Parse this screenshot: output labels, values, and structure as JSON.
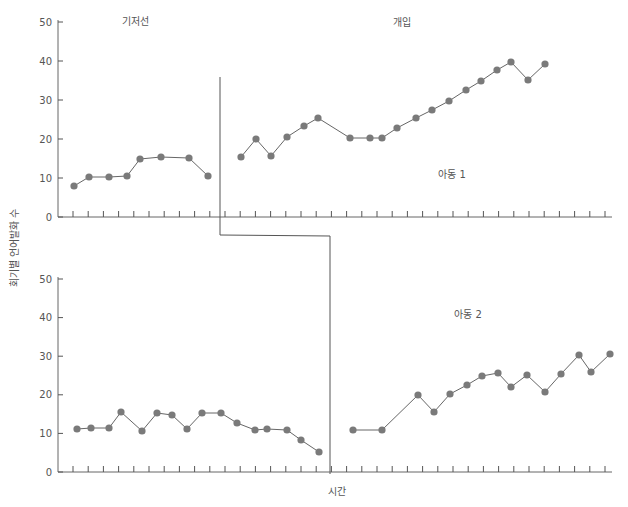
{
  "figure": {
    "y_axis_label": "회기별 언어발화 수",
    "x_axis_label": "시간",
    "phase_labels": {
      "baseline": "기저선",
      "intervention": "개입"
    },
    "colors": {
      "axis": "#555555",
      "line": "#666666",
      "marker": "#7a7a7a",
      "text": "#555555"
    }
  },
  "chart_data": [
    {
      "type": "line",
      "title": "아동 1",
      "xlabel": "",
      "ylabel": "회기별 언어발화 수",
      "ylim": [
        0,
        50
      ],
      "yticks": [
        0,
        10,
        20,
        30,
        40,
        50
      ],
      "grid": false,
      "phase_change_after_session": 10,
      "series": [
        {
          "name": "기저선",
          "x": [
            1,
            2,
            3,
            4,
            5,
            6,
            7,
            8,
            9,
            10
          ],
          "values": [
            8,
            10,
            10,
            10.5,
            14.5,
            15.2,
            null,
            15,
            10.5,
            null
          ]
        },
        {
          "name": "개입",
          "x": [
            12,
            13,
            14,
            15,
            16,
            17,
            18,
            19,
            20,
            21,
            22,
            23,
            24,
            25,
            26,
            27,
            28,
            29,
            30,
            31
          ],
          "values": [
            15,
            20,
            15.5,
            20.2,
            23,
            25,
            20,
            20,
            20,
            22.5,
            25,
            27.3,
            29.5,
            32.3,
            34.5,
            37.5,
            39.7,
            35,
            39.2,
            null
          ]
        }
      ]
    },
    {
      "type": "line",
      "title": "아동 2",
      "xlabel": "시간",
      "ylabel": "회기별 언어발화 수",
      "ylim": [
        0,
        50
      ],
      "yticks": [
        0,
        10,
        20,
        30,
        40,
        50
      ],
      "grid": false,
      "phase_change_after_session": 17,
      "series": [
        {
          "name": "기저선",
          "x": [
            1,
            2,
            3,
            4,
            5,
            6,
            7,
            8,
            9,
            10,
            11,
            12,
            13,
            14,
            15,
            16,
            17
          ],
          "values": [
            11,
            11.2,
            11.2,
            15.5,
            10.5,
            15,
            14.5,
            11,
            15,
            15,
            12.5,
            10.8,
            11.2,
            10.8,
            8,
            5
          ]
        },
        {
          "name": "개입",
          "x": [
            19,
            20,
            21,
            22,
            23,
            24,
            25,
            26,
            27,
            28,
            29,
            30,
            31,
            32,
            33,
            34,
            35
          ],
          "values": [
            10.5,
            10.5,
            19.8,
            15.2,
            20,
            22.3,
            24.5,
            25.5,
            21.6,
            24.8,
            20.4,
            25.2,
            30,
            25.5,
            30.2
          ]
        }
      ]
    }
  ],
  "plot": {
    "top": {
      "label": "아동 1",
      "baseline_points": [
        [
          74,
          186
        ],
        [
          89,
          177
        ],
        [
          109,
          177
        ],
        [
          127,
          176
        ],
        [
          140,
          159
        ],
        [
          161,
          157
        ],
        [
          189,
          158
        ],
        [
          208,
          176
        ]
      ],
      "intervention_points": [
        [
          241,
          157
        ],
        [
          256,
          139
        ],
        [
          271,
          156
        ],
        [
          287,
          137
        ],
        [
          304,
          126
        ],
        [
          318,
          118
        ],
        [
          350,
          138
        ],
        [
          370,
          138
        ],
        [
          382,
          138
        ],
        [
          397,
          128
        ],
        [
          416,
          118
        ],
        [
          432,
          110
        ],
        [
          449,
          101
        ],
        [
          466,
          90
        ],
        [
          481,
          81
        ],
        [
          497,
          70
        ],
        [
          511,
          62
        ],
        [
          528,
          80
        ],
        [
          545,
          64
        ]
      ]
    },
    "bottom": {
      "label": "아동 2",
      "baseline_points": [
        [
          77,
          429
        ],
        [
          91,
          428
        ],
        [
          109,
          428
        ],
        [
          121,
          412
        ],
        [
          142,
          431
        ],
        [
          157,
          413
        ],
        [
          172,
          415
        ],
        [
          187,
          429
        ],
        [
          202,
          413
        ],
        [
          221,
          413
        ],
        [
          237,
          423
        ],
        [
          255,
          430
        ],
        [
          267,
          429
        ],
        [
          287,
          430
        ],
        [
          301,
          440
        ],
        [
          319,
          452
        ]
      ],
      "intervention_points": [
        [
          353,
          430
        ],
        [
          382,
          430
        ],
        [
          418,
          395
        ],
        [
          434,
          412
        ],
        [
          450,
          394
        ],
        [
          467,
          385
        ],
        [
          482,
          376
        ],
        [
          498,
          373
        ],
        [
          511,
          387
        ],
        [
          527,
          375
        ],
        [
          545,
          392
        ],
        [
          561,
          374
        ],
        [
          579,
          355
        ],
        [
          591,
          372
        ],
        [
          610,
          354
        ]
      ]
    }
  }
}
